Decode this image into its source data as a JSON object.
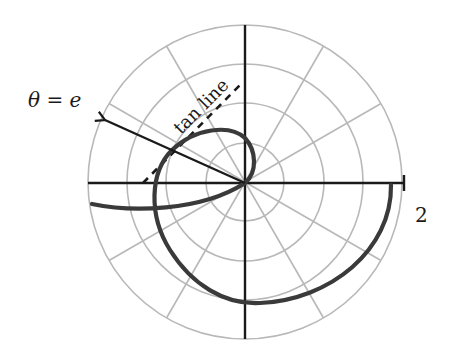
{
  "diagram": {
    "type": "polar-plot",
    "labels": {
      "theta_label": "θ = e",
      "tangent_label": "tan line",
      "radius_tick": "2"
    },
    "grid": {
      "rings": 4,
      "radial_spacing_deg": 30,
      "max_radius_value": 2
    },
    "elements": [
      {
        "name": "polar-curve",
        "description": "spiral-like curve through origin with loop"
      },
      {
        "name": "ray-theta-e",
        "description": "arrow from origin at angle θ = e"
      },
      {
        "name": "tangent-line",
        "description": "dashed tangent line"
      }
    ],
    "colors": {
      "grid": "#b8b8b8",
      "axis": "#1a1a1a",
      "curve": "#3a3a3a"
    }
  }
}
